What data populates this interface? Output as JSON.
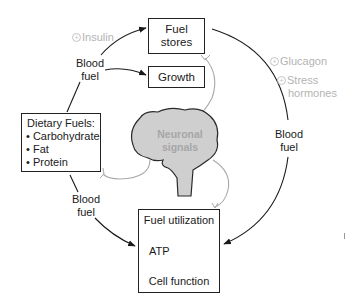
{
  "diagram": {
    "nodes": {
      "fuel_stores": {
        "line1": "Fuel",
        "line2": "stores"
      },
      "growth": {
        "label": "Growth"
      },
      "dietary_fuels": {
        "title": "Dietary Fuels:",
        "items": [
          "• Carbohydrate",
          "• Fat",
          "• Protein"
        ]
      },
      "brain": {
        "line1": "Neuronal",
        "line2": "signals"
      },
      "fuel_utilization": {
        "title": "Fuel utilization",
        "atp": "ATP",
        "cell_function": "Cell function"
      }
    },
    "labels": {
      "blood_fuel_top": {
        "line1": "Blood",
        "line2": "fuel"
      },
      "blood_fuel_right": {
        "line1": "Blood",
        "line2": "fuel"
      },
      "blood_fuel_bottom": {
        "line1": "Blood",
        "line2": "fuel"
      },
      "insulin": "Insulin",
      "glucagon": "Glucagon",
      "stress_line1": "Stress",
      "stress_line2": "hormones",
      "plus_symbol": "+"
    },
    "colors": {
      "line": "#1a1a1a",
      "signal_line": "#a8a8a8",
      "brain_fill": "#cfcfcf",
      "hormone_text": "#b3b3b3"
    }
  }
}
